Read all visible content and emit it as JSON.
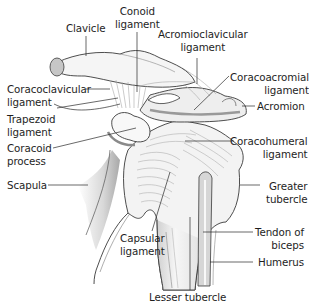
{
  "diagram": {
    "colors": {
      "outline": "#3a3a3a",
      "bone_fill": "#f4f4f4",
      "shade": "#b8b8b8",
      "dark_shade": "#8a8a8a",
      "leader": "#2a2a2a",
      "text": "#1e1e1e"
    },
    "labels": {
      "clavicle": "Clavicle",
      "conoid": "Conoid\nligament",
      "acromioclavicular": "Acromioclavicular\nligament",
      "coracoclavicular": "Coracoclavicular\nligament",
      "coracoacromial": "Coracoacromial\nligament",
      "acromion": "Acromion",
      "trapezoid": "Trapezoid\nligament",
      "coracoid": "Coracoid\nprocess",
      "coracohumeral": "Coracohumeral\nligament",
      "scapula": "Scapula",
      "greater_tubercle": "Greater\ntubercle",
      "capsular": "Capsular\nligament",
      "tendon_biceps": "Tendon of\nbiceps",
      "humerus": "Humerus",
      "lesser_tubercle": "Lesser tubercle"
    }
  }
}
